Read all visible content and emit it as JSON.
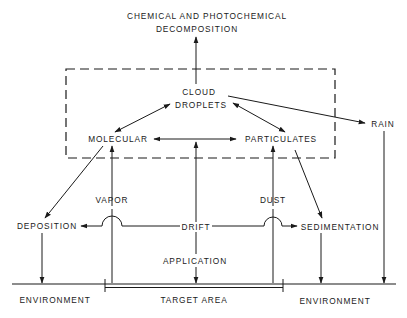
{
  "diagram": {
    "title_line1": "CHEMICAL AND PHOTOCHEMICAL",
    "title_line2": "DECOMPOSITION",
    "nodes": {
      "cloud_line1": "CLOUD",
      "cloud_line2": "DROPLETS",
      "molecular": "MOLECULAR",
      "particulates": "PARTICULATES",
      "rain": "RAIN",
      "vapor": "VAPOR",
      "dust": "DUST",
      "drift": "DRIFT",
      "deposition": "DEPOSITION",
      "sedimentation": "SEDIMENTATION",
      "application": "APPLICATION",
      "environment_left": "ENVIRONMENT",
      "target_area": "TARGET AREA",
      "environment_right": "ENVIRONMENT"
    },
    "edges": [
      {
        "from": "CLOUD DROPLETS",
        "to": "CHEMICAL AND PHOTOCHEMICAL DECOMPOSITION"
      },
      {
        "from": "CLOUD DROPLETS",
        "to": "MOLECULAR",
        "bidirectional": true
      },
      {
        "from": "CLOUD DROPLETS",
        "to": "PARTICULATES",
        "bidirectional": true
      },
      {
        "from": "MOLECULAR",
        "to": "PARTICULATES",
        "bidirectional": true
      },
      {
        "from": "CLOUD DROPLETS",
        "to": "RAIN"
      },
      {
        "from": "RAIN",
        "to": "ENVIRONMENT"
      },
      {
        "from": "MOLECULAR",
        "to": "DEPOSITION"
      },
      {
        "from": "PARTICULATES",
        "to": "SEDIMENTATION"
      },
      {
        "from": "VAPOR",
        "to": "MOLECULAR"
      },
      {
        "from": "DUST",
        "to": "PARTICULATES"
      },
      {
        "from": "DRIFT",
        "to": "DEPOSITION"
      },
      {
        "from": "DRIFT",
        "to": "SEDIMENTATION"
      },
      {
        "from": "DEPOSITION",
        "to": "ENVIRONMENT"
      },
      {
        "from": "SEDIMENTATION",
        "to": "ENVIRONMENT"
      },
      {
        "from": "APPLICATION",
        "to": "TARGET AREA"
      },
      {
        "from": "APPLICATION",
        "to": "PARTICULATES BOX (atmosphere)"
      }
    ],
    "colors": {
      "ink": "#1a1a1a",
      "background": "#ffffff"
    }
  }
}
